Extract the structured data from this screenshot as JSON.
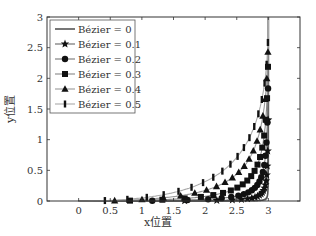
{
  "chart_data": {
    "type": "line",
    "title": "",
    "xlabel": "x位置",
    "ylabel": "y位置",
    "xlim": [
      -0.5,
      3.5
    ],
    "ylim": [
      0,
      3
    ],
    "xticks": [
      "0",
      "0.5",
      "1",
      "1.5",
      "2",
      "2.5",
      "3"
    ],
    "yticks": [
      "0",
      "0.5",
      "1",
      "1.5",
      "2",
      "2.5",
      "3"
    ],
    "grid": false,
    "legend_position": "upper left",
    "series": [
      {
        "name": "Bézier = 0",
        "marker": "none",
        "weight": 0.0,
        "color": "#555555"
      },
      {
        "name": "Bézier = 0.1",
        "marker": "star",
        "weight": 0.1,
        "color": "#666666"
      },
      {
        "name": "Bézier = 0.2",
        "marker": "circle",
        "weight": 0.2,
        "color": "#777777"
      },
      {
        "name": "Bézier = 0.3",
        "marker": "square",
        "weight": 0.3,
        "color": "#888888"
      },
      {
        "name": "Bézier = 0.4",
        "marker": "triangle",
        "weight": 0.4,
        "color": "#999999"
      },
      {
        "name": "Bézier = 0.5",
        "marker": "bar",
        "weight": 0.5,
        "color": "#aaaaaa"
      }
    ],
    "curve_start": [
      0,
      0
    ],
    "curve_end": [
      3,
      3
    ],
    "corner": [
      3,
      0
    ]
  }
}
